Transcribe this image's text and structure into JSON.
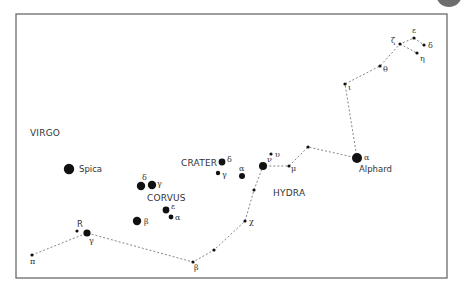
{
  "frame": {
    "x": 16,
    "y": 14,
    "width": 431,
    "height": 264,
    "stroke": "#6b6b6b"
  },
  "corner_badge": {
    "cx": 449,
    "cy": -6,
    "r": 13,
    "color": "#6e6e6e"
  },
  "constellations": {
    "virgo": {
      "label": "VIRGO",
      "x": 30,
      "y": 136
    },
    "corvus": {
      "label": "CORVUS",
      "x": 147,
      "y": 201
    },
    "crater": {
      "label": "CRATER",
      "x": 181,
      "y": 166
    },
    "hydra": {
      "label": "HYDRA",
      "x": 273,
      "y": 196
    }
  },
  "named_stars": {
    "spica": {
      "label": "Spica",
      "x": 79,
      "y": 172
    },
    "alphard": {
      "label": "Alphard",
      "x": 359,
      "y": 142
    }
  },
  "stars": [
    {
      "id": "spica",
      "x": 69,
      "y": 169,
      "r": 5.2,
      "greek": "",
      "lx": 0,
      "ly": 0
    },
    {
      "id": "corvus-delta",
      "x": 141,
      "y": 186,
      "r": 4.2,
      "greek": "δ",
      "lx": 142,
      "ly": 180
    },
    {
      "id": "corvus-gamma",
      "x": 152,
      "y": 185,
      "r": 4.2,
      "greek": "γ",
      "lx": 157,
      "ly": 186
    },
    {
      "id": "corvus-epsilon",
      "x": 166,
      "y": 210,
      "r": 3.4,
      "greek": "ε",
      "lx": 171,
      "ly": 209
    },
    {
      "id": "corvus-alpha",
      "x": 171,
      "y": 217,
      "r": 2.4,
      "greek": "α",
      "lx": 175,
      "ly": 220
    },
    {
      "id": "corvus-beta",
      "x": 137,
      "y": 221,
      "r": 4.2,
      "greek": "β",
      "lx": 144,
      "ly": 224
    },
    {
      "id": "crater-delta",
      "x": 222,
      "y": 162,
      "r": 3.4,
      "greek": "δ",
      "lx": 227,
      "ly": 162
    },
    {
      "id": "crater-gamma",
      "x": 218,
      "y": 173,
      "r": 2.2,
      "greek": "γ",
      "lx": 222,
      "ly": 177
    },
    {
      "id": "crater-alpha",
      "x": 242,
      "y": 176,
      "r": 3.0,
      "greek": "α",
      "lx": 239,
      "ly": 171
    },
    {
      "id": "hydra-alphard",
      "x": 357,
      "y": 158,
      "r": 5.0,
      "greek": "α",
      "lx": 364,
      "ly": 160
    },
    {
      "id": "hydra-nu",
      "x": 263,
      "y": 166,
      "r": 4.0,
      "greek": "ν",
      "lx": 267,
      "ly": 162
    },
    {
      "id": "hydra-upsilon",
      "x": 271,
      "y": 154,
      "r": 1.6,
      "greek": "υ",
      "lx": 275,
      "ly": 157
    },
    {
      "id": "hydra-mu",
      "x": 289,
      "y": 166,
      "r": 1.6,
      "greek": "μ",
      "lx": 291,
      "ly": 171
    },
    {
      "id": "hydra-chi",
      "x": 245,
      "y": 221,
      "r": 1.6,
      "greek": "χ",
      "lx": 249,
      "ly": 224
    },
    {
      "id": "hydra-beta",
      "x": 193,
      "y": 262,
      "r": 1.6,
      "greek": "β",
      "lx": 194,
      "ly": 270
    },
    {
      "id": "hydra-gamma",
      "x": 87,
      "y": 233,
      "r": 3.6,
      "greek": "γ",
      "lx": 89,
      "ly": 243
    },
    {
      "id": "hydra-R",
      "x": 77,
      "y": 231,
      "r": 1.6,
      "greek": "R",
      "lx": 77,
      "ly": 227
    },
    {
      "id": "hydra-pi",
      "x": 32,
      "y": 255,
      "r": 1.6,
      "greek": "π",
      "lx": 30,
      "ly": 264
    },
    {
      "id": "hydra-iota",
      "x": 345,
      "y": 84,
      "r": 1.6,
      "greek": "ι",
      "lx": 348,
      "ly": 90
    },
    {
      "id": "hydra-theta",
      "x": 380,
      "y": 66,
      "r": 1.6,
      "greek": "θ",
      "lx": 383,
      "ly": 72
    },
    {
      "id": "hydra-zeta",
      "x": 400,
      "y": 44,
      "r": 1.6,
      "greek": "ζ",
      "lx": 391,
      "ly": 43
    },
    {
      "id": "hydra-epsilon",
      "x": 414,
      "y": 38,
      "r": 1.6,
      "greek": "ε",
      "lx": 412,
      "ly": 33
    },
    {
      "id": "hydra-delta",
      "x": 424,
      "y": 45,
      "r": 1.6,
      "greek": "δ",
      "lx": 428,
      "ly": 48
    },
    {
      "id": "hydra-eta",
      "x": 417,
      "y": 53,
      "r": 1.6,
      "greek": "η",
      "lx": 420,
      "ly": 61
    },
    {
      "id": "hydra-mid1",
      "x": 308,
      "y": 147,
      "r": 1.6,
      "greek": "",
      "lx": 0,
      "ly": 0
    },
    {
      "id": "hydra-mid2",
      "x": 254,
      "y": 190,
      "r": 1.6,
      "greek": "",
      "lx": 0,
      "ly": 0
    },
    {
      "id": "hydra-mid3",
      "x": 214,
      "y": 250,
      "r": 1.6,
      "greek": "",
      "lx": 0,
      "ly": 0
    }
  ],
  "hydra_path": "M32,255 L87,233 L193,262 L214,250 L245,221 L254,190 L263,166 L289,166 L308,147 L357,158 L345,84 L380,66 L400,44 L414,38 L424,45 M400,44 L417,53"
}
